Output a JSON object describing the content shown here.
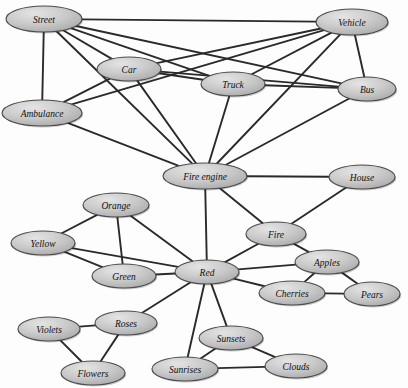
{
  "diagram": {
    "width": 408,
    "height": 388,
    "background_color": "#fdfdfd",
    "node_fill_color": "#c9c9c9",
    "node_fill_highlight": "#e2e2e2",
    "node_border_color": "#4a4a4a",
    "edge_color": "#2a2a2a",
    "label_color": "#111111"
  },
  "nodes": [
    {
      "id": "street",
      "label": "Street",
      "cx": 44,
      "cy": 19,
      "rx": 38,
      "ry": 13
    },
    {
      "id": "vehicle",
      "label": "Vehicle",
      "cx": 352,
      "cy": 22,
      "rx": 36,
      "ry": 13
    },
    {
      "id": "car",
      "label": "Car",
      "cx": 129,
      "cy": 69,
      "rx": 32,
      "ry": 12
    },
    {
      "id": "truck",
      "label": "Truck",
      "cx": 233,
      "cy": 84,
      "rx": 32,
      "ry": 12
    },
    {
      "id": "bus",
      "label": "Bus",
      "cx": 367,
      "cy": 89,
      "rx": 29,
      "ry": 12
    },
    {
      "id": "ambulance",
      "label": "Ambulance",
      "cx": 42,
      "cy": 113,
      "rx": 40,
      "ry": 13
    },
    {
      "id": "fireengine",
      "label": "Fire engine",
      "cx": 205,
      "cy": 176,
      "rx": 42,
      "ry": 13
    },
    {
      "id": "house",
      "label": "House",
      "cx": 362,
      "cy": 177,
      "rx": 33,
      "ry": 12
    },
    {
      "id": "orange",
      "label": "Orange",
      "cx": 116,
      "cy": 205,
      "rx": 33,
      "ry": 12
    },
    {
      "id": "fire",
      "label": "Fire",
      "cx": 276,
      "cy": 234,
      "rx": 30,
      "ry": 12
    },
    {
      "id": "yellow",
      "label": "Yellow",
      "cx": 43,
      "cy": 243,
      "rx": 32,
      "ry": 12
    },
    {
      "id": "green",
      "label": "Green",
      "cx": 124,
      "cy": 276,
      "rx": 32,
      "ry": 12
    },
    {
      "id": "red",
      "label": "Red",
      "cx": 207,
      "cy": 272,
      "rx": 32,
      "ry": 12
    },
    {
      "id": "apples",
      "label": "Apples",
      "cx": 327,
      "cy": 262,
      "rx": 32,
      "ry": 12
    },
    {
      "id": "cherries",
      "label": "Cherries",
      "cx": 292,
      "cy": 293,
      "rx": 33,
      "ry": 12
    },
    {
      "id": "pears",
      "label": "Pears",
      "cx": 372,
      "cy": 294,
      "rx": 28,
      "ry": 12
    },
    {
      "id": "violets",
      "label": "Violets",
      "cx": 49,
      "cy": 329,
      "rx": 31,
      "ry": 12
    },
    {
      "id": "roses",
      "label": "Roses",
      "cx": 126,
      "cy": 323,
      "rx": 31,
      "ry": 12
    },
    {
      "id": "sunsets",
      "label": "Sunsets",
      "cx": 231,
      "cy": 338,
      "rx": 32,
      "ry": 12
    },
    {
      "id": "flowers",
      "label": "Flowers",
      "cx": 93,
      "cy": 373,
      "rx": 32,
      "ry": 12
    },
    {
      "id": "sunrises",
      "label": "Sunrises",
      "cx": 185,
      "cy": 369,
      "rx": 33,
      "ry": 12
    },
    {
      "id": "clouds",
      "label": "Clouds",
      "cx": 296,
      "cy": 366,
      "rx": 31,
      "ry": 12
    }
  ],
  "edges": [
    {
      "from": "street",
      "to": "vehicle"
    },
    {
      "from": "street",
      "to": "car"
    },
    {
      "from": "street",
      "to": "truck"
    },
    {
      "from": "street",
      "to": "bus"
    },
    {
      "from": "street",
      "to": "ambulance"
    },
    {
      "from": "street",
      "to": "fireengine"
    },
    {
      "from": "vehicle",
      "to": "car"
    },
    {
      "from": "vehicle",
      "to": "truck"
    },
    {
      "from": "vehicle",
      "to": "bus"
    },
    {
      "from": "vehicle",
      "to": "ambulance"
    },
    {
      "from": "vehicle",
      "to": "fireengine"
    },
    {
      "from": "car",
      "to": "truck"
    },
    {
      "from": "car",
      "to": "ambulance"
    },
    {
      "from": "car",
      "to": "fireengine"
    },
    {
      "from": "car",
      "to": "bus"
    },
    {
      "from": "truck",
      "to": "bus"
    },
    {
      "from": "truck",
      "to": "fireengine"
    },
    {
      "from": "bus",
      "to": "fireengine"
    },
    {
      "from": "ambulance",
      "to": "fireengine"
    },
    {
      "from": "fireengine",
      "to": "house"
    },
    {
      "from": "fireengine",
      "to": "fire"
    },
    {
      "from": "fireengine",
      "to": "red"
    },
    {
      "from": "house",
      "to": "fire"
    },
    {
      "from": "fire",
      "to": "red"
    },
    {
      "from": "fire",
      "to": "apples"
    },
    {
      "from": "orange",
      "to": "yellow"
    },
    {
      "from": "orange",
      "to": "green"
    },
    {
      "from": "orange",
      "to": "red"
    },
    {
      "from": "yellow",
      "to": "green"
    },
    {
      "from": "yellow",
      "to": "red"
    },
    {
      "from": "green",
      "to": "red"
    },
    {
      "from": "red",
      "to": "apples"
    },
    {
      "from": "red",
      "to": "cherries"
    },
    {
      "from": "red",
      "to": "roses"
    },
    {
      "from": "red",
      "to": "sunsets"
    },
    {
      "from": "red",
      "to": "sunrises"
    },
    {
      "from": "apples",
      "to": "cherries"
    },
    {
      "from": "apples",
      "to": "pears"
    },
    {
      "from": "cherries",
      "to": "pears"
    },
    {
      "from": "violets",
      "to": "roses"
    },
    {
      "from": "violets",
      "to": "flowers"
    },
    {
      "from": "roses",
      "to": "flowers"
    },
    {
      "from": "sunsets",
      "to": "sunrises"
    },
    {
      "from": "sunsets",
      "to": "clouds"
    },
    {
      "from": "sunrises",
      "to": "clouds"
    }
  ]
}
